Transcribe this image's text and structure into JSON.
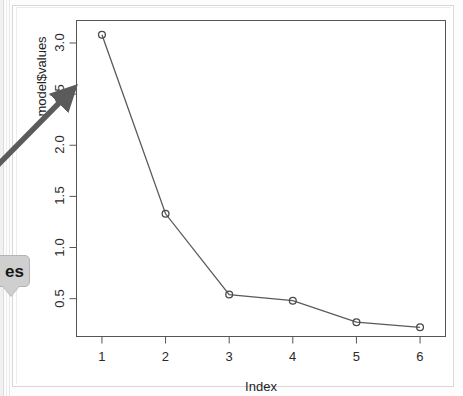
{
  "chart_data": {
    "type": "line",
    "title": "",
    "subtitle": "",
    "xlabel": "Index",
    "ylabel": "model$values",
    "x": [
      1,
      2,
      3,
      4,
      5,
      6
    ],
    "values": [
      3.08,
      1.33,
      0.54,
      0.48,
      0.27,
      0.22
    ],
    "categories": [
      "1",
      "2",
      "3",
      "4",
      "5",
      "6"
    ],
    "series": [
      {
        "name": "model$values",
        "values": [
          3.08,
          1.33,
          0.54,
          0.48,
          0.27,
          0.22
        ]
      }
    ],
    "xlim": [
      0.6,
      6.4
    ],
    "ylim": [
      0.13,
      3.22
    ],
    "x_ticks": [
      "1",
      "2",
      "3",
      "4",
      "5",
      "6"
    ],
    "x_tick_values": [
      1,
      2,
      3,
      4,
      5,
      6
    ],
    "y_ticks": [
      "0.5",
      "1.0",
      "1.5",
      "2.0",
      "2.5",
      "3.0"
    ],
    "y_tick_values": [
      0.5,
      1.0,
      1.5,
      2.0,
      2.5,
      3.0
    ],
    "grid": false,
    "legend": false,
    "legend_position": "none",
    "marker": "open-circle",
    "line_color": "#5a5a5a",
    "marker_color": "#4a4a4a",
    "axis_color": "#555555",
    "plot_background": "#ffffff"
  },
  "annotations": {
    "arrow": {
      "name": "annotation-arrow",
      "color": "#5b5b5b",
      "direction": "up-right",
      "label": ""
    },
    "callout": {
      "name": "callout-bubble",
      "text": "es",
      "background": "#cfcfcf",
      "border": "#b4b4b4",
      "text_color": "#171717"
    }
  },
  "figure": {
    "frame_color": "#d8d8d8",
    "background": "#ffffff"
  }
}
